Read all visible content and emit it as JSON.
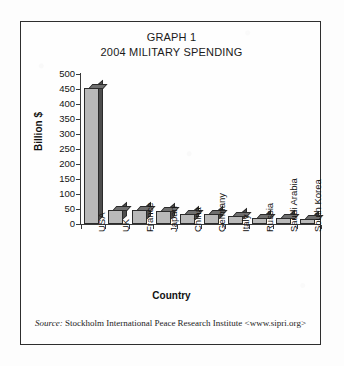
{
  "figure": {
    "title_line1": "GRAPH 1",
    "title_line2": "2004 MILITARY SPENDING",
    "source_prefix": "Source:",
    "source_text": "Stockholm International Peace Research Institute <www.sipri.org>",
    "frame_color": "#2e2e2e",
    "bar_face_color": "#b9b9b9",
    "bar_side_color": "#4d4d4d",
    "bar_top_color": "#6f6f6f",
    "axis_color": "#3a3a3a"
  },
  "chart_data": {
    "type": "bar",
    "xlabel": "Country",
    "ylabel": "Billion $",
    "ylim": [
      0,
      500
    ],
    "yticks": [
      0,
      50,
      100,
      150,
      200,
      250,
      300,
      350,
      400,
      450,
      500
    ],
    "grid": false,
    "legend": "none",
    "categories": [
      "USA",
      "UK",
      "France",
      "Japan",
      "China",
      "Germany",
      "Italy",
      "Russia",
      "Saudi Arabia",
      "South Korea"
    ],
    "values": [
      455,
      47,
      46,
      42,
      35,
      34,
      28,
      19,
      19,
      16
    ],
    "units": "Billion $"
  }
}
